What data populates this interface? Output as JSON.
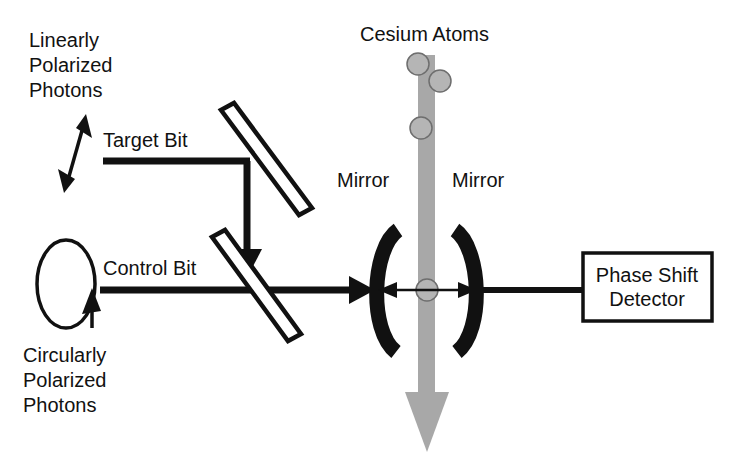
{
  "diagram": {
    "title_visible": false,
    "background_color": "#ffffff",
    "ink_color": "#111111",
    "beam_color": "#a8a8a8",
    "atom_fill": "#b5b5b5",
    "atom_stroke": "#6e6e6e",
    "labels": {
      "linearly_line1": "Linearly",
      "linearly_line2": "Polarized",
      "linearly_line3": "Photons",
      "circularly_line1": "Circularly",
      "circularly_line2": "Polarized",
      "circularly_line3": "Photons",
      "target_bit": "Target Bit",
      "control_bit": "Control Bit",
      "cesium_atoms": "Cesium Atoms",
      "mirror_left": "Mirror",
      "mirror_right": "Mirror",
      "detector_line1": "Phase Shift",
      "detector_line2": "Detector"
    },
    "components": {
      "beam_splitter_upper": "beam-splitter",
      "beam_splitter_lower": "beam-splitter",
      "cavity_mirror_left": "concave-mirror",
      "cavity_mirror_right": "concave-mirror",
      "phase_shift_detector": "detector-box",
      "linear_polarization_arrow": "double-headed-arrow",
      "circular_polarization_loop": "circular-arrow-ellipse",
      "atom_count": 4
    }
  }
}
